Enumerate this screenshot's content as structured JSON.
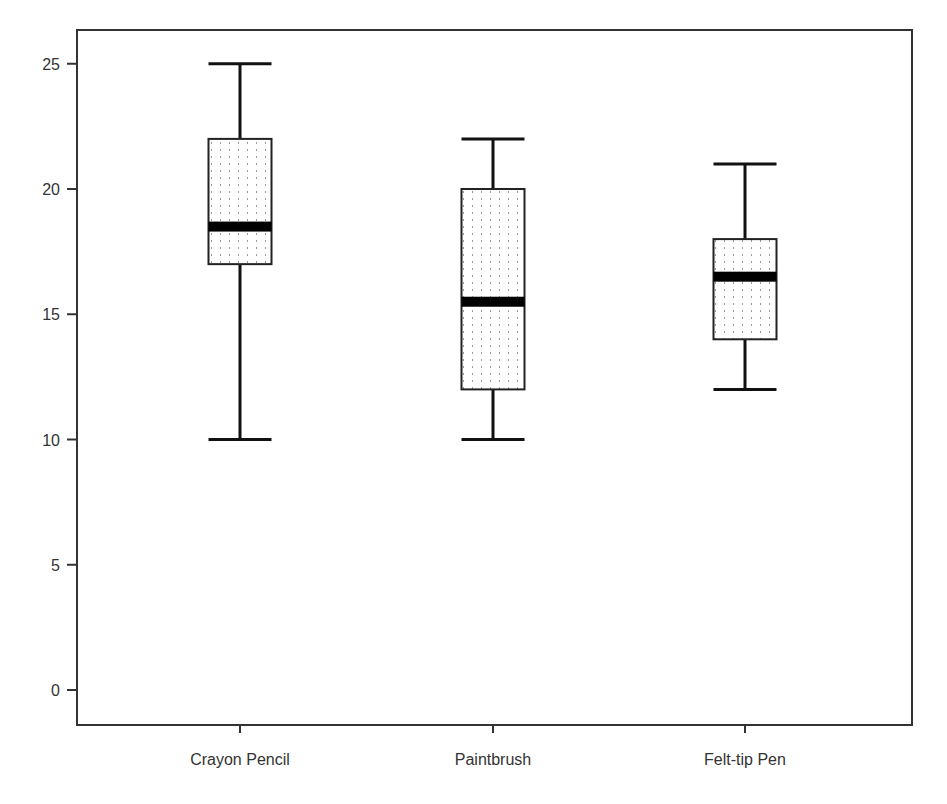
{
  "chart_data": {
    "type": "boxplot",
    "title": "",
    "xlabel": "",
    "ylabel": "",
    "categories": [
      "Crayon Pencil",
      "Paintbrush",
      "Felt-tip Pen"
    ],
    "series": [
      {
        "name": "Crayon Pencil",
        "whisker_low": 10,
        "q1": 17,
        "median": 18.5,
        "q3": 22,
        "whisker_high": 25
      },
      {
        "name": "Paintbrush",
        "whisker_low": 10,
        "q1": 12,
        "median": 15.5,
        "q3": 20,
        "whisker_high": 22
      },
      {
        "name": "Felt-tip Pen",
        "whisker_low": 12,
        "q1": 14,
        "median": 16.5,
        "q3": 18,
        "whisker_high": 21
      }
    ],
    "yticks": [
      0,
      5,
      10,
      15,
      20,
      25
    ],
    "ylim": [
      -1.4,
      26.4
    ],
    "grid": false,
    "legend": null,
    "box_fill": "dotted pattern",
    "colors": {
      "frame": "#333333",
      "box_stroke": "#222222",
      "median": "#000000",
      "dots": "#888888",
      "background": "#ffffff"
    }
  }
}
